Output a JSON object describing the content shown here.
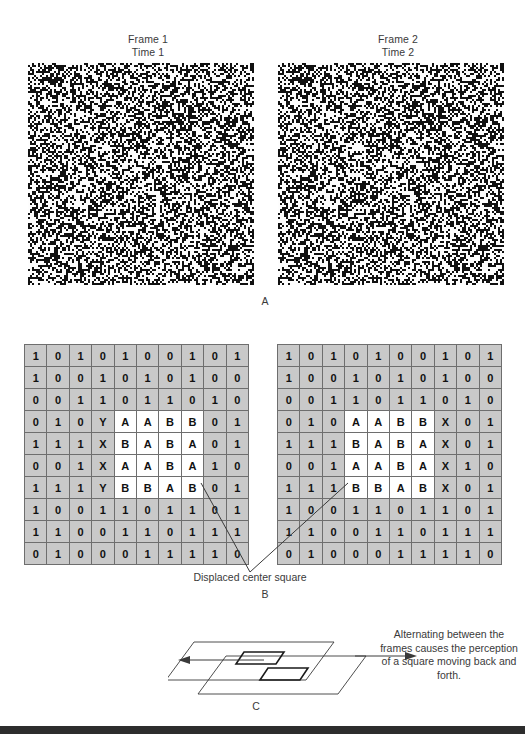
{
  "figure": {
    "panels": [
      {
        "letter": "A"
      },
      {
        "letter": "B"
      },
      {
        "letter": "C"
      }
    ]
  },
  "panel_a": {
    "letter": "A",
    "frame1_label": "Frame 1\nTime 1",
    "frame2_label": "Frame 2\nTime 2",
    "frame1": {
      "title": "Frame 1",
      "time": "Time 1",
      "image_name": "random-dot-pattern-frame-1"
    },
    "frame2": {
      "title": "Frame 2",
      "time": "Time 2",
      "image_name": "random-dot-pattern-frame-2"
    }
  },
  "panel_b": {
    "letter": "B",
    "caption": "Displaced center square",
    "grid_size": 10,
    "grid1": [
      [
        "1",
        "0",
        "1",
        "0",
        "1",
        "0",
        "0",
        "1",
        "0",
        "1"
      ],
      [
        "1",
        "0",
        "0",
        "1",
        "0",
        "1",
        "0",
        "1",
        "0",
        "0"
      ],
      [
        "0",
        "0",
        "1",
        "1",
        "0",
        "1",
        "1",
        "0",
        "1",
        "0"
      ],
      [
        "0",
        "1",
        "0",
        "Y",
        "A",
        "A",
        "B",
        "B",
        "0",
        "1"
      ],
      [
        "1",
        "1",
        "1",
        "X",
        "B",
        "A",
        "B",
        "A",
        "0",
        "1"
      ],
      [
        "0",
        "0",
        "1",
        "X",
        "A",
        "A",
        "B",
        "A",
        "1",
        "0"
      ],
      [
        "1",
        "1",
        "1",
        "Y",
        "B",
        "B",
        "A",
        "B",
        "0",
        "1"
      ],
      [
        "1",
        "0",
        "0",
        "1",
        "1",
        "0",
        "1",
        "1",
        "0",
        "1"
      ],
      [
        "1",
        "1",
        "0",
        "0",
        "1",
        "1",
        "0",
        "1",
        "1",
        "1"
      ],
      [
        "0",
        "1",
        "0",
        "0",
        "0",
        "1",
        "1",
        "1",
        "1",
        "0"
      ]
    ],
    "grid1_center_cols": [
      4,
      5,
      6,
      7
    ],
    "grid1_center_rows": [
      3,
      4,
      5,
      6
    ],
    "grid2": [
      [
        "1",
        "0",
        "1",
        "0",
        "1",
        "0",
        "0",
        "1",
        "0",
        "1"
      ],
      [
        "1",
        "0",
        "0",
        "1",
        "0",
        "1",
        "0",
        "1",
        "0",
        "0"
      ],
      [
        "0",
        "0",
        "1",
        "1",
        "0",
        "1",
        "1",
        "0",
        "1",
        "0"
      ],
      [
        "0",
        "1",
        "0",
        "A",
        "A",
        "B",
        "B",
        "X",
        "0",
        "1"
      ],
      [
        "1",
        "1",
        "1",
        "B",
        "A",
        "B",
        "A",
        "X",
        "0",
        "1"
      ],
      [
        "0",
        "0",
        "1",
        "A",
        "A",
        "B",
        "A",
        "X",
        "1",
        "0"
      ],
      [
        "1",
        "1",
        "1",
        "B",
        "B",
        "A",
        "B",
        "X",
        "0",
        "1"
      ],
      [
        "1",
        "0",
        "0",
        "1",
        "1",
        "0",
        "1",
        "1",
        "0",
        "1"
      ],
      [
        "1",
        "1",
        "0",
        "0",
        "1",
        "1",
        "0",
        "1",
        "1",
        "1"
      ],
      [
        "0",
        "1",
        "0",
        "0",
        "0",
        "1",
        "1",
        "1",
        "1",
        "0"
      ]
    ],
    "grid2_center_cols": [
      3,
      4,
      5,
      6
    ],
    "grid2_center_rows": [
      3,
      4,
      5,
      6
    ]
  },
  "panel_c": {
    "letter": "C",
    "caption": "Alternating between the frames causes the perception of a square moving back and forth.",
    "diagram_name": "stacked-planes-with-square"
  },
  "colors": {
    "cell_gray": "#c9c9c9",
    "cell_white": "#ffffff",
    "cell_border": "#6e6e6e",
    "text": "#3a3a3a",
    "dot_black": "#111111",
    "bottom_bar": "#2d2d2d"
  }
}
